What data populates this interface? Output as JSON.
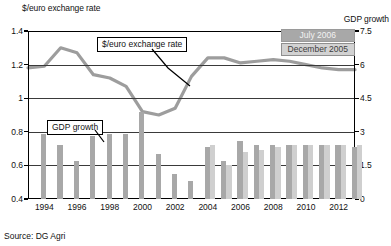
{
  "chart_data": {
    "type": "bar",
    "title": "",
    "xlabel": "",
    "ylabel": "$/euro exchange rate",
    "y2label": "GDP growth",
    "ylim": [
      0.4,
      1.4
    ],
    "y2lim": [
      0,
      7.5
    ],
    "grid": true,
    "legend_position": "top-right",
    "x": [
      1993,
      1994,
      1995,
      1996,
      1997,
      1998,
      1999,
      2000,
      2001,
      2002,
      2003,
      2004,
      2005,
      2006,
      2007,
      2008,
      2009,
      2010,
      2011,
      2012,
      2013
    ],
    "categories": [
      "1993",
      "1994",
      "1995",
      "1996",
      "1997",
      "1998",
      "1999",
      "2000",
      "2001",
      "2002",
      "2003",
      "2004",
      "2005",
      "2006",
      "2007",
      "2008",
      "2009",
      "2010",
      "2011",
      "2012",
      "2013"
    ],
    "left_ticks": [
      "0.4",
      "0.6",
      "0.8",
      "1",
      "1.2",
      "1.4"
    ],
    "left_tick_values": [
      0.4,
      0.6,
      0.8,
      1.0,
      1.2,
      1.4
    ],
    "right_ticks": [
      "0",
      "1.5",
      "3",
      "4.5",
      "6",
      "7.5"
    ],
    "right_tick_values": [
      0,
      1.5,
      3,
      4.5,
      6,
      7.5
    ],
    "x_tick_labels": [
      "1994",
      "1996",
      "1998",
      "2000",
      "2002",
      "2004",
      "2006",
      "2008",
      "2010",
      "2012"
    ],
    "x_tick_values": [
      1994,
      1996,
      1998,
      2000,
      2002,
      2004,
      2006,
      2008,
      2010,
      2012
    ],
    "series": [
      {
        "name": "July 2006",
        "type": "bar",
        "color": "#a8a8a8",
        "axis": "right",
        "values": [
          null,
          2.9,
          2.4,
          1.7,
          2.8,
          2.9,
          2.9,
          3.9,
          2.0,
          1.1,
          0.8,
          2.3,
          1.7,
          2.6,
          2.4,
          2.4,
          2.4,
          2.4,
          2.4,
          2.4,
          2.3
        ]
      },
      {
        "name": "December 2005",
        "type": "bar",
        "color": "#cfcfcf",
        "axis": "right",
        "values": [
          null,
          null,
          null,
          null,
          null,
          null,
          null,
          null,
          null,
          null,
          null,
          2.4,
          1.5,
          2.1,
          2.2,
          2.3,
          2.4,
          2.4,
          2.4,
          2.4,
          2.4
        ]
      },
      {
        "name": "$/euro exchange rate",
        "type": "line",
        "color": "#9d9d9d",
        "axis": "left",
        "values": [
          1.18,
          1.19,
          1.3,
          1.27,
          1.14,
          1.12,
          1.07,
          0.92,
          0.9,
          0.94,
          1.13,
          1.24,
          1.24,
          1.21,
          1.22,
          1.23,
          1.22,
          1.2,
          1.18,
          1.17,
          1.17
        ]
      }
    ],
    "annotations": [
      {
        "text": "$/euro exchange rate",
        "target": "line"
      },
      {
        "text": "GDP growth",
        "target": "bar"
      }
    ]
  },
  "legend": {
    "items": [
      {
        "label": "July 2006"
      },
      {
        "label": "December 2005"
      }
    ]
  },
  "axes": {
    "left_title": "$/euro exchange rate",
    "right_title": "GDP growth"
  },
  "callouts": {
    "exchange_rate": "$/euro exchange rate",
    "gdp_growth": "GDP growth"
  },
  "footer": {
    "source": "Source: DG Agri"
  },
  "colors": {
    "july_bar": "#a8a8a8",
    "december_bar": "#cfcfcf",
    "line": "#9d9d9d",
    "axis": "#000000",
    "grid": "#3a3a3a"
  }
}
